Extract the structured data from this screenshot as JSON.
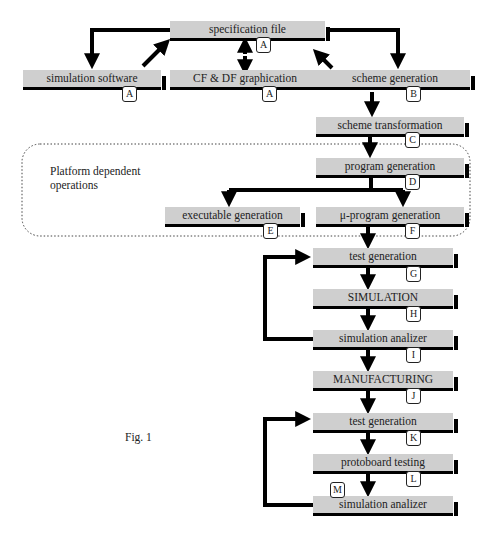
{
  "figure": {
    "caption": "Fig. 1",
    "region_label": "Platform dependent operations",
    "region_label_lines": [
      "Platform dependent",
      "operations"
    ],
    "nodes": [
      {
        "id": "spec",
        "label": "specification file",
        "badge": "A"
      },
      {
        "id": "simsw",
        "label": "simulation software",
        "badge": "A"
      },
      {
        "id": "cfdf",
        "label": "CF & DF graphication",
        "badge": "A"
      },
      {
        "id": "schgen",
        "label": "scheme generation",
        "badge": "B"
      },
      {
        "id": "schtr",
        "label": "scheme transformation",
        "badge": "C"
      },
      {
        "id": "proggen",
        "label": "program generation",
        "badge": "D"
      },
      {
        "id": "exegen",
        "label": "executable generation",
        "badge": "E"
      },
      {
        "id": "uproggen",
        "label": "μ-program generation",
        "badge": "F"
      },
      {
        "id": "testgen1",
        "label": "test generation",
        "badge": "G"
      },
      {
        "id": "sim",
        "label": "SIMULATION",
        "badge": "H"
      },
      {
        "id": "simanal1",
        "label": "simulation analizer",
        "badge": "I"
      },
      {
        "id": "manuf",
        "label": "MANUFACTURING",
        "badge": "J"
      },
      {
        "id": "testgen2",
        "label": "test generation",
        "badge": "K"
      },
      {
        "id": "proto",
        "label": "protoboard testing",
        "badge": "L"
      },
      {
        "id": "simanal2",
        "label": "simulation analizer",
        "badge": "M"
      }
    ],
    "edges": [
      [
        "spec",
        "simsw"
      ],
      [
        "simsw",
        "spec"
      ],
      [
        "spec",
        "cfdf"
      ],
      [
        "cfdf",
        "spec"
      ],
      [
        "spec",
        "schgen"
      ],
      [
        "schgen",
        "spec"
      ],
      [
        "schgen",
        "schtr"
      ],
      [
        "schtr",
        "proggen"
      ],
      [
        "proggen",
        "exegen"
      ],
      [
        "proggen",
        "uproggen"
      ],
      [
        "uproggen",
        "testgen1"
      ],
      [
        "testgen1",
        "sim"
      ],
      [
        "sim",
        "simanal1"
      ],
      [
        "simanal1",
        "testgen1"
      ],
      [
        "simanal1",
        "manuf"
      ],
      [
        "manuf",
        "testgen2"
      ],
      [
        "testgen2",
        "proto"
      ],
      [
        "proto",
        "simanal2"
      ],
      [
        "simanal2",
        "testgen2"
      ]
    ]
  }
}
